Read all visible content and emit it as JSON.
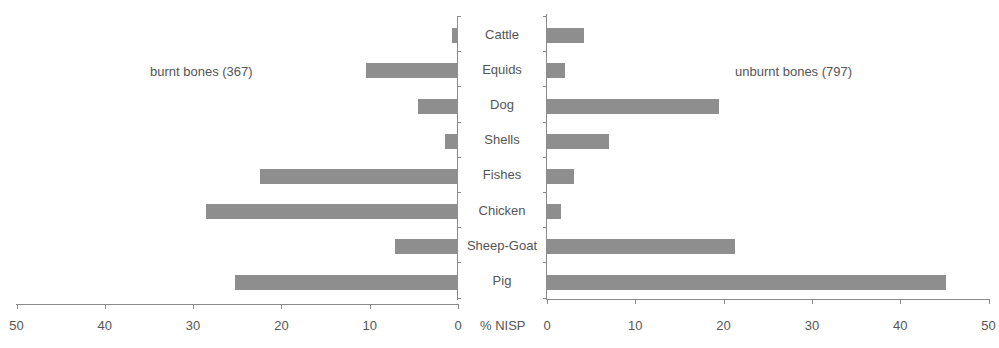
{
  "chart_data": {
    "type": "bar",
    "orientation": "horizontal",
    "layout": "back-to-back (population pyramid style)",
    "categories": [
      "Cattle",
      "Equids",
      "Dog",
      "Shells",
      "Fishes",
      "Chicken",
      "Sheep-Goat",
      "Pig"
    ],
    "series": [
      {
        "name": "burnt bones (367)",
        "side": "left",
        "values": [
          0.7,
          10.4,
          4.5,
          1.5,
          22.4,
          28.5,
          7.1,
          25.3
        ]
      },
      {
        "name": "unburnt bones (797)",
        "side": "right",
        "values": [
          4.2,
          2.0,
          19.5,
          7.0,
          3.1,
          1.6,
          21.3,
          45.2
        ]
      }
    ],
    "xlabel": "% NISP",
    "ylabel": "",
    "xlim_left": [
      50,
      0
    ],
    "xlim_right": [
      0,
      50
    ],
    "x_ticks_left": [
      "50",
      "40",
      "30",
      "20",
      "10",
      "0"
    ],
    "x_ticks_right": [
      "0",
      "10",
      "20",
      "30",
      "40",
      "50"
    ],
    "grid": false,
    "bar_color": "#8e8e8e"
  },
  "labels": {
    "left_series": "burnt bones (367)",
    "right_series": "unburnt bones (797)",
    "axis_title": "% NISP"
  }
}
